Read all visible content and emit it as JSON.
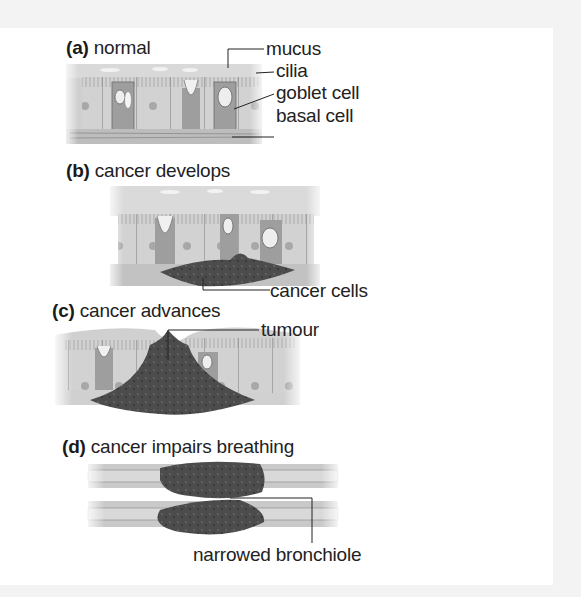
{
  "figure": {
    "panels": [
      {
        "id": "a",
        "letter": "(a)",
        "title": "normal",
        "labels": [
          "mucus",
          "cilia",
          "goblet cell",
          "basal cell"
        ]
      },
      {
        "id": "b",
        "letter": "(b)",
        "title": "cancer develops",
        "labels": [
          "cancer cells"
        ]
      },
      {
        "id": "c",
        "letter": "(c)",
        "title": "cancer advances",
        "labels": [
          "tumour"
        ]
      },
      {
        "id": "d",
        "letter": "(d)",
        "title": "cancer impairs breathing",
        "labels": [
          "narrowed bronchiole"
        ]
      }
    ]
  },
  "colors": {
    "tissue_light": "#d6d6d6",
    "tissue_mid": "#b4b4b4",
    "goblet": "#9a9a9a",
    "tumour": "#4a4a4a",
    "text": "#222222",
    "border": "#f3f3f3"
  }
}
